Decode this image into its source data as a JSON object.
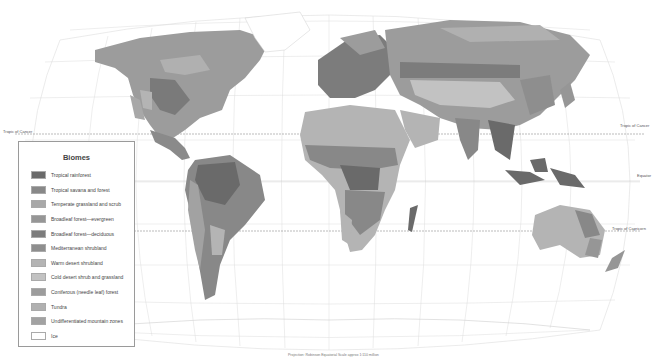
{
  "map": {
    "projection_labels": {
      "tropic_of_cancer_left": "Tropic of Cancer",
      "tropic_of_cancer_right": "Tropic of Cancer",
      "equator": "Equator",
      "tropic_of_capricorn": "Tropic of Capricorn"
    },
    "caption": "Projection: Robinson    Equatorial Scale approx 1:110 million",
    "colors": {
      "ocean": "#ffffff",
      "graticule": "#d8d8d8",
      "reference_line": "#777777"
    }
  },
  "legend": {
    "title": "Biomes",
    "items": [
      {
        "label": "Tropical rainforest",
        "color": "#6a6a6a"
      },
      {
        "label": "Tropical savana and forest",
        "color": "#888888"
      },
      {
        "label": "Temperate grassland and scrub",
        "color": "#a8a8a8"
      },
      {
        "label": "Broadleaf forest—evergreen",
        "color": "#969696"
      },
      {
        "label": "Broadleaf forest—deciduous",
        "color": "#7c7c7c"
      },
      {
        "label": "Mediterranean shrubland",
        "color": "#8e8e8e"
      },
      {
        "label": "Warm desert shrubland",
        "color": "#b4b4b4"
      },
      {
        "label": "Cold desert shrub and grassland",
        "color": "#c2c2c2"
      },
      {
        "label": "Coniferous (needle leaf) forest",
        "color": "#9c9c9c"
      },
      {
        "label": "Tundra",
        "color": "#b0b0b0"
      },
      {
        "label": "Undifferentiated mountain zones",
        "color": "#a2a2a2"
      },
      {
        "label": "Ice",
        "color": "#ffffff"
      }
    ]
  }
}
